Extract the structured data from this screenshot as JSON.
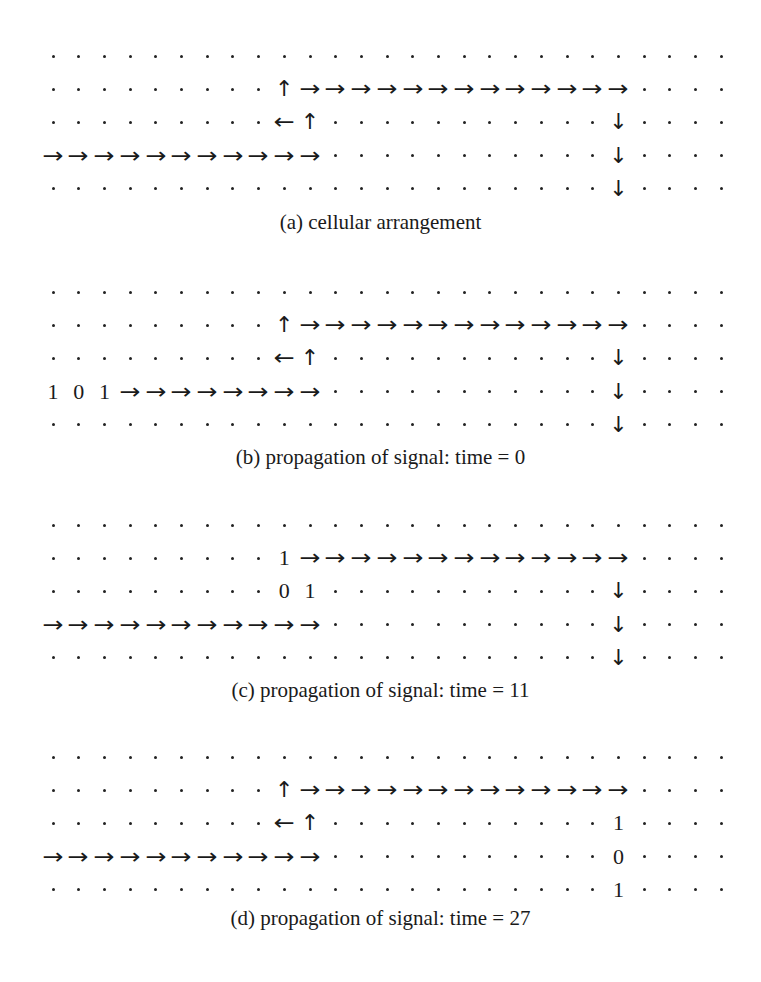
{
  "grid": {
    "columns": 27,
    "x0": 53,
    "col_step": 25.7,
    "row_step": 33.2
  },
  "legend": {
    ".": "cell",
    ">": "right-arrow",
    "<": "left-arrow",
    "^": "up-arrow",
    "v": "down-arrow",
    "0": "bit-0",
    "1": "bit-1"
  },
  "panels": [
    {
      "id": "a",
      "top": 56,
      "caption_y": 210,
      "caption": "(a) cellular arrangement",
      "rows": [
        "...........................",
        ".........^>>>>>>>>>>>>>....",
        ".........<^...........v....",
        ">>>>>>>>>>>...........v....",
        "......................v...."
      ]
    },
    {
      "id": "b",
      "top": 292,
      "caption_y": 445,
      "caption": "(b) propagation of signal: time = 0",
      "rows": [
        "...........................",
        ".........^>>>>>>>>>>>>>....",
        ".........<^...........v....",
        "101>>>>>>>>...........v....",
        "......................v...."
      ]
    },
    {
      "id": "c",
      "top": 525,
      "caption_y": 678,
      "caption": "(c) propagation of signal: time = 11",
      "rows": [
        "...........................",
        ".........1>>>>>>>>>>>>>....",
        ".........01...........v....",
        ">>>>>>>>>>>...........v....",
        "......................v...."
      ]
    },
    {
      "id": "d",
      "top": 757,
      "caption_y": 906,
      "caption": "(d) propagation of signal: time = 27",
      "rows": [
        "...........................",
        ".........^>>>>>>>>>>>>>....",
        ".........<^...........1....",
        ">>>>>>>>>>>...........0....",
        "......................1...."
      ]
    }
  ]
}
